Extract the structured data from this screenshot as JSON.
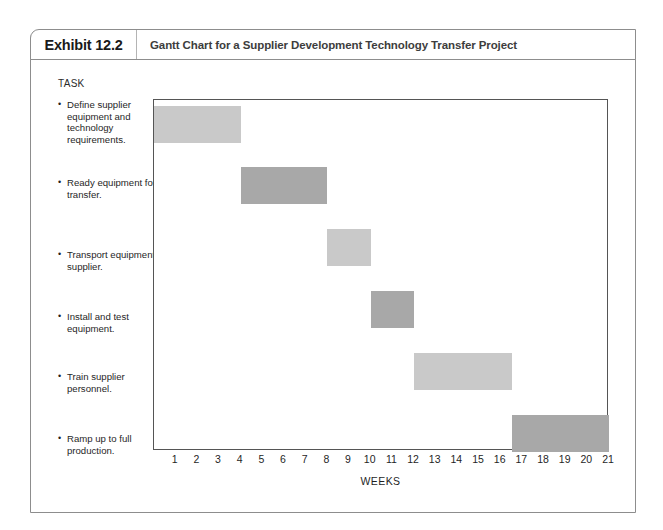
{
  "exhibit": {
    "number": "Exhibit 12.2",
    "title": "Gantt Chart for a Supplier Development Technology Transfer Project"
  },
  "chart_data": {
    "type": "bar",
    "chart_kind": "gantt",
    "title": "Gantt Chart for a Supplier Development Technology Transfer Project",
    "xlabel": "WEEKS",
    "ylabel": "TASK",
    "xlim": [
      0,
      21
    ],
    "grid": false,
    "legend": null,
    "tick_labels": [
      "1",
      "2",
      "3",
      "4",
      "5",
      "6",
      "7",
      "8",
      "9",
      "10",
      "11",
      "12",
      "13",
      "14",
      "15",
      "16",
      "17",
      "18",
      "19",
      "20",
      "21"
    ],
    "categories": [
      "Define supplier equipment and technology requirements.",
      "Ready equipment for transfer.",
      "Transport equipment to supplier.",
      "Install and test equipment.",
      "Train supplier personnel.",
      "Ramp up to full production."
    ],
    "bars": [
      {
        "task": "Define supplier equipment and technology requirements.",
        "start": 0,
        "end": 4,
        "duration": 4,
        "color": "#c9c9c9"
      },
      {
        "task": "Ready equipment for transfer.",
        "start": 4,
        "end": 8,
        "duration": 4,
        "color": "#a8a8a8"
      },
      {
        "task": "Transport equipment to supplier.",
        "start": 8,
        "end": 10,
        "duration": 2,
        "color": "#c9c9c9"
      },
      {
        "task": "Install and test equipment.",
        "start": 10,
        "end": 12,
        "duration": 2,
        "color": "#a8a8a8"
      },
      {
        "task": "Train supplier personnel.",
        "start": 12,
        "end": 16.5,
        "duration": 4.5,
        "color": "#c9c9c9"
      },
      {
        "task": "Ramp up to full production.",
        "start": 16.5,
        "end": 21,
        "duration": 4.5,
        "color": "#a8a8a8"
      }
    ]
  },
  "tasks": [
    {
      "label": "Define supplier equipment and technology requirements."
    },
    {
      "label": "Ready equipment for transfer."
    },
    {
      "label": "Transport equipment to supplier."
    },
    {
      "label": "Install and test equipment."
    },
    {
      "label": "Train supplier personnel."
    },
    {
      "label": "Ramp up to full production."
    }
  ],
  "labels": {
    "task_header": "TASK",
    "axis_title": "WEEKS"
  },
  "colors": {
    "bar_light": "#c9c9c9",
    "bar_dark": "#a8a8a8",
    "frame": "#8d8d8d",
    "plot_border": "#555555"
  }
}
